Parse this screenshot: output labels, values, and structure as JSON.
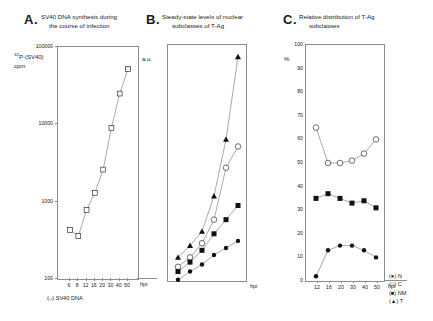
{
  "figure": {
    "legend": [
      {
        "glyph": "(●)",
        "label": "N"
      },
      {
        "glyph": "(○)",
        "label": "C"
      },
      {
        "glyph": "(■)",
        "label": "NM"
      },
      {
        "glyph": "(▲)",
        "label": "T"
      }
    ]
  },
  "panelA": {
    "letter": "A.",
    "title_line1": "SV40 DNA synthesis during",
    "title_line2": "the course of infection",
    "ylabel_sup": "32",
    "ylabel_main": "P-(SV40)",
    "ylabel_line2": "cpm",
    "xlabel": "hpi",
    "caption": "(□) SV40 DNA"
  },
  "panelB": {
    "letter": "B.",
    "title_line1": "Steady-state levels of nuclear",
    "title_line2": "subclasses of T-Ag",
    "ylabel": "a.u.",
    "xlabel": "hpi"
  },
  "panelC": {
    "letter": "C.",
    "title_line1": "Relative distribution of T-Ag",
    "title_line2": "subclasses",
    "ylabel": "%",
    "xlabel": "hpi"
  },
  "chart_data": [
    {
      "type": "line",
      "panel": "A",
      "title": "SV40 DNA synthesis during the course of infection",
      "xlabel": "hpi",
      "ylabel": "32P-(SV40) cpm",
      "yscale": "log",
      "ylim": [
        100,
        100000
      ],
      "yticks": [
        100,
        1000,
        10000,
        100000
      ],
      "ytick_labels": [
        "100",
        "1000",
        "10000",
        "100000"
      ],
      "categories": [
        6,
        8,
        12,
        16,
        20,
        30,
        40,
        50
      ],
      "xtick_labels": [
        "6",
        "8",
        "12",
        "16",
        "20",
        "30",
        "40",
        "50"
      ],
      "series": [
        {
          "name": "SV40 DNA",
          "marker": "open-square",
          "values": [
            430,
            360,
            780,
            1300,
            2600,
            9000,
            25000,
            52000
          ]
        }
      ]
    },
    {
      "type": "line",
      "panel": "B",
      "title": "Steady-state levels of nuclear subclasses of T-Ag",
      "xlabel": "hpi",
      "ylabel": "a.u.",
      "ylim": [
        0,
        100
      ],
      "yticks": [
        0,
        10,
        20,
        30,
        40,
        50,
        60,
        70,
        80,
        90,
        100
      ],
      "categories": [
        12,
        16,
        20,
        30,
        40,
        50
      ],
      "xtick_labels": [
        "12",
        "16",
        "20",
        "30",
        "40",
        "50"
      ],
      "series": [
        {
          "name": "T",
          "marker": "filled-triangle",
          "values": [
            10,
            15,
            21,
            36,
            60,
            95
          ]
        },
        {
          "name": "C",
          "marker": "open-circle",
          "values": [
            6,
            10,
            16,
            26,
            48,
            57
          ]
        },
        {
          "name": "NM",
          "marker": "filled-square",
          "values": [
            4,
            8,
            13,
            20,
            26,
            32
          ]
        },
        {
          "name": "N",
          "marker": "filled-circle",
          "values": [
            0.5,
            4,
            7,
            11,
            14,
            17
          ]
        }
      ]
    },
    {
      "type": "line",
      "panel": "C",
      "title": "Relative distribution of T-Ag subclasses",
      "xlabel": "hpi",
      "ylabel": "%",
      "ylim": [
        0,
        100
      ],
      "yticks": [
        0,
        10,
        20,
        30,
        40,
        50,
        60,
        70,
        80,
        90,
        100
      ],
      "categories": [
        12,
        16,
        20,
        30,
        40,
        50
      ],
      "xtick_labels": [
        "12",
        "16",
        "20",
        "30",
        "40",
        "50"
      ],
      "series": [
        {
          "name": "C",
          "marker": "open-circle",
          "values": [
            65,
            50,
            50,
            51,
            54,
            60
          ]
        },
        {
          "name": "NM",
          "marker": "filled-square",
          "values": [
            35,
            37,
            35,
            33,
            34,
            31
          ]
        },
        {
          "name": "N",
          "marker": "filled-circle",
          "values": [
            2,
            13,
            15,
            15,
            13,
            10
          ]
        }
      ]
    }
  ]
}
